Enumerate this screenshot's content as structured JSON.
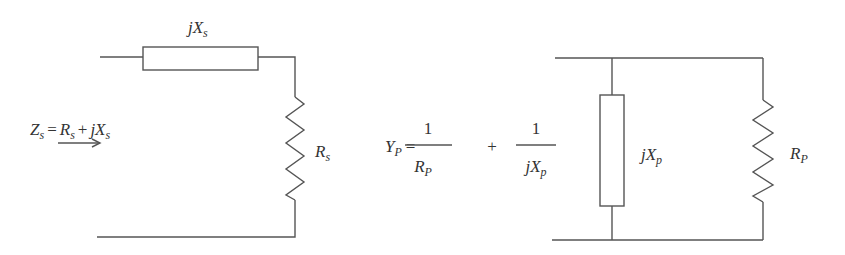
{
  "series_circuit": {
    "reactance_label": {
      "base": "jX",
      "sub": "s"
    },
    "resistance_label": {
      "base": "R",
      "sub": "s"
    },
    "impedance_equation": {
      "lhs": {
        "base": "Z",
        "sub": "s"
      },
      "eq": "=",
      "term1": {
        "base": "R",
        "sub": "s"
      },
      "plus": "+",
      "term2": {
        "base": "jX",
        "sub": "s"
      }
    },
    "arrow": "→"
  },
  "parallel_circuit": {
    "reactance_label": {
      "base": "jX",
      "sub": "p"
    },
    "resistance_label": {
      "base": "R",
      "sub": "P"
    },
    "admittance_equation": {
      "lhs": {
        "base": "Y",
        "sub": "P"
      },
      "eq": "=",
      "frac1": {
        "num": "1",
        "den": {
          "base": "R",
          "sub": "P"
        }
      },
      "plus": "+",
      "frac2": {
        "num": "1",
        "den": {
          "base": "jX",
          "sub": "p"
        }
      }
    }
  },
  "colors": {
    "wire": "#555555",
    "text": "#333333",
    "background": "#ffffff"
  }
}
